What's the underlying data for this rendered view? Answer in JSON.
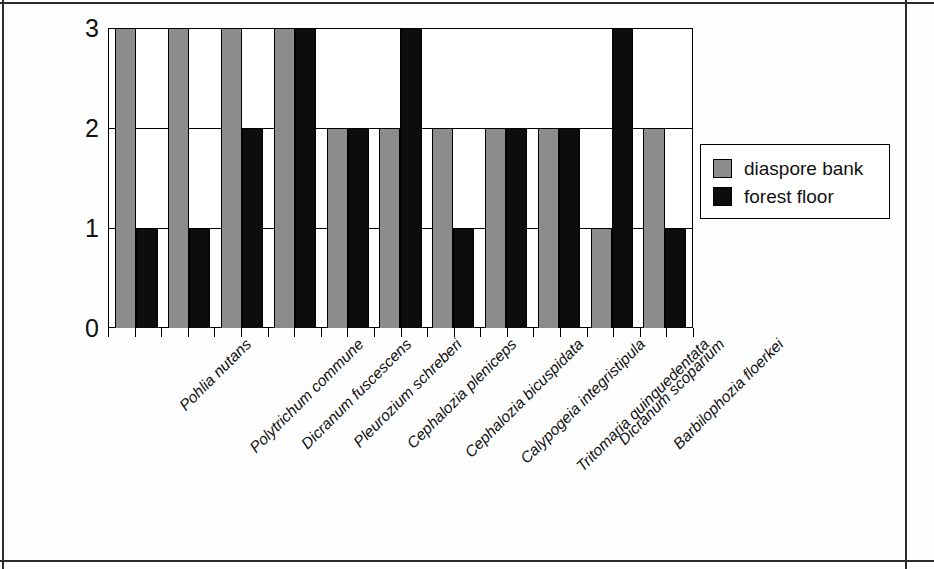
{
  "chart_data": {
    "type": "bar",
    "title": "",
    "subtitle": "",
    "xlabel": "",
    "ylabel": "",
    "ylim": [
      0,
      3
    ],
    "yticks": [
      "0",
      "1",
      "2",
      "3"
    ],
    "grid": true,
    "legend_position": "right",
    "categories": [
      "Pohlia nutans",
      "Polytrichum commune",
      "Dicranum fuscescens",
      "Pleurozium schreberi",
      "Cephalozia pleniceps",
      "Cephalozia bicuspidata",
      "Calypogeia integristipula",
      "Tritomaria quinquedentata",
      "Dicranum scoparium",
      "Barbilophozia floerkei",
      ""
    ],
    "series": [
      {
        "name": "diaspore bank",
        "color": "#8c8c8c",
        "values": [
          3,
          3,
          3,
          3,
          2,
          2,
          2,
          2,
          2,
          1,
          2
        ]
      },
      {
        "name": "forest floor",
        "color": "#0d0d0d",
        "values": [
          1,
          1,
          2,
          3,
          2,
          3,
          1,
          2,
          2,
          3,
          1
        ]
      }
    ]
  },
  "legend": {
    "entries": [
      {
        "label": "diaspore bank",
        "swatch": "gray-swatch"
      },
      {
        "label": "forest floor",
        "swatch": "black-swatch"
      }
    ]
  }
}
